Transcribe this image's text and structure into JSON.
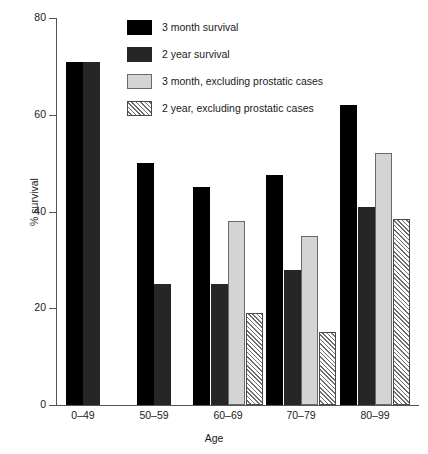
{
  "chart_data": {
    "type": "bar",
    "title": "",
    "xlabel": "Age",
    "ylabel": "% survival",
    "categories": [
      "0–49",
      "50–59",
      "60–69",
      "70–79",
      "80–99"
    ],
    "ylim": [
      0,
      80
    ],
    "yticks": [
      0,
      20,
      40,
      60,
      80
    ],
    "ytick_labels": [
      "0",
      "20",
      "40",
      "60",
      "80"
    ],
    "grid": false,
    "legend_position": "top-right-inside",
    "series": [
      {
        "name": "3 month survival",
        "color": "#000000",
        "pattern": "solid",
        "values": [
          71,
          50,
          45,
          47.5,
          62
        ]
      },
      {
        "name": "2 year survival",
        "color": "#262626",
        "pattern": "solid",
        "values": [
          71,
          25,
          25,
          28,
          41
        ]
      },
      {
        "name": "3 month, excluding prostatic cases",
        "color": "#d4d4d4",
        "pattern": "solid",
        "values": [
          null,
          null,
          38,
          35,
          52
        ]
      },
      {
        "name": "2 year, excluding prostatic cases",
        "color": "#ffffff",
        "pattern": "diagonal-hatch",
        "values": [
          null,
          null,
          19,
          15,
          38.5
        ]
      }
    ]
  },
  "axes": {
    "y_title": "% survival",
    "x_title": "Age"
  }
}
